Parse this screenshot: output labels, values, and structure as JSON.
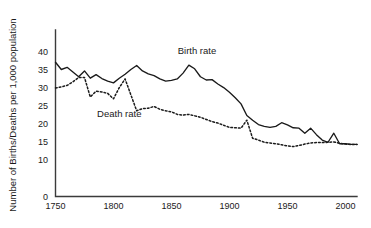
{
  "chart_data": {
    "type": "line",
    "title": "",
    "subtitle": "",
    "xlabel": "",
    "ylabel": "Number of Births/Deaths per 1,000 population",
    "xlim": [
      1750,
      2010
    ],
    "ylim": [
      0,
      41
    ],
    "grid": false,
    "legend_position": "inline-annotation",
    "xticks": [
      1750,
      1800,
      1850,
      1900,
      1950,
      2000
    ],
    "xticklabels": [
      "1750",
      "1800",
      "1850",
      "1900",
      "1950",
      "2000"
    ],
    "yticks": [
      0,
      10,
      15,
      20,
      25,
      30,
      35,
      40
    ],
    "yticklabels": [
      "0",
      "10",
      "15",
      "20",
      "25",
      "30",
      "35",
      "40"
    ],
    "annotations": [
      {
        "text": "Birth rate",
        "x": 1872,
        "y": 39.2
      },
      {
        "text": "Death rate",
        "x": 1805,
        "y": 22.0
      }
    ],
    "series": [
      {
        "name": "Birth rate",
        "style": "solid",
        "color": "#1a1a1a",
        "x": [
          1750,
          1755,
          1760,
          1765,
          1770,
          1775,
          1780,
          1785,
          1790,
          1795,
          1800,
          1805,
          1810,
          1815,
          1820,
          1825,
          1830,
          1835,
          1840,
          1845,
          1850,
          1855,
          1860,
          1865,
          1870,
          1875,
          1880,
          1885,
          1890,
          1895,
          1900,
          1905,
          1910,
          1915,
          1920,
          1925,
          1930,
          1935,
          1940,
          1945,
          1950,
          1955,
          1960,
          1965,
          1970,
          1975,
          1980,
          1985,
          1990,
          1995,
          2000,
          2005,
          2010
        ],
        "values": [
          37.0,
          35.0,
          35.6,
          34.3,
          33.0,
          34.6,
          32.6,
          33.6,
          32.5,
          31.8,
          31.3,
          32.6,
          33.7,
          35.0,
          36.1,
          34.6,
          33.8,
          33.3,
          32.4,
          31.8,
          32.0,
          32.4,
          34.0,
          36.2,
          35.2,
          33.0,
          32.1,
          32.2,
          31.0,
          30.0,
          28.7,
          27.2,
          25.5,
          22.3,
          21.0,
          19.8,
          19.3,
          19.0,
          19.3,
          20.3,
          19.7,
          18.9,
          18.8,
          17.4,
          18.8,
          17.0,
          15.5,
          14.9,
          17.4,
          14.5,
          14.5,
          14.3,
          14.3
        ]
      },
      {
        "name": "Death rate",
        "style": "dotted",
        "color": "#1a1a1a",
        "x": [
          1750,
          1755,
          1760,
          1765,
          1770,
          1775,
          1780,
          1785,
          1790,
          1795,
          1800,
          1805,
          1810,
          1815,
          1820,
          1825,
          1830,
          1835,
          1840,
          1845,
          1850,
          1855,
          1860,
          1865,
          1870,
          1875,
          1880,
          1885,
          1890,
          1895,
          1900,
          1905,
          1910,
          1915,
          1920,
          1925,
          1930,
          1935,
          1940,
          1945,
          1950,
          1955,
          1960,
          1965,
          1970,
          1975,
          1980,
          1985,
          1990,
          1995,
          2000,
          2005,
          2010
        ],
        "values": [
          29.9,
          30.2,
          30.6,
          31.6,
          32.8,
          32.8,
          27.4,
          29.0,
          28.8,
          28.4,
          26.9,
          30.0,
          32.4,
          28.0,
          23.6,
          24.2,
          24.3,
          24.8,
          24.0,
          23.6,
          23.3,
          22.6,
          22.4,
          22.6,
          22.2,
          21.8,
          21.2,
          20.6,
          20.2,
          19.6,
          19.0,
          18.9,
          18.8,
          21.0,
          16.0,
          15.5,
          14.9,
          14.7,
          14.5,
          14.2,
          13.9,
          13.7,
          14.0,
          14.4,
          14.7,
          14.8,
          14.8,
          14.9,
          15.0,
          14.6,
          14.4,
          14.3,
          14.3
        ]
      }
    ]
  }
}
